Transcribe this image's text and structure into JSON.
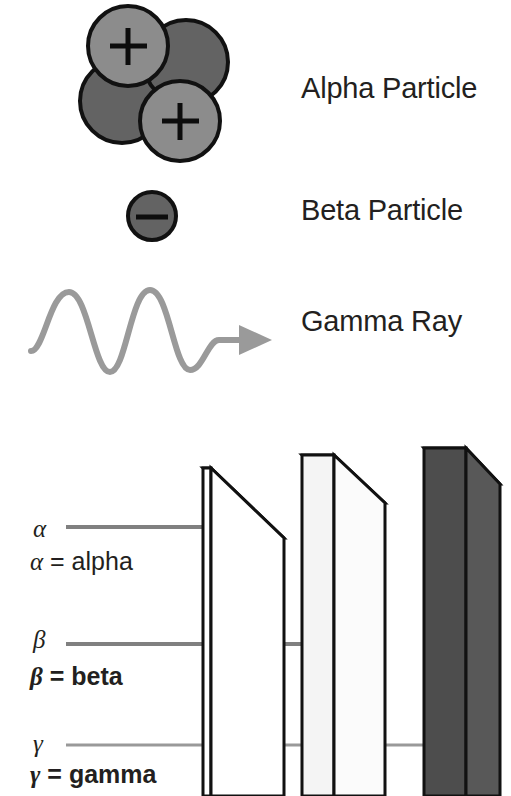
{
  "figure": {
    "background": "#ffffff"
  },
  "legend": {
    "items": [
      {
        "id": "alpha",
        "label": "Alpha Particle",
        "icon": "alpha-particle-icon",
        "charges": [
          "+",
          "+"
        ],
        "nucleon_count": 4
      },
      {
        "id": "beta",
        "label": "Beta Particle",
        "icon": "beta-particle-icon",
        "charges": [
          "–"
        ],
        "nucleon_count": 1
      },
      {
        "id": "gamma",
        "label": "Gamma Ray",
        "icon": "gamma-ray-wave-icon",
        "charges": [],
        "nucleon_count": 0
      }
    ]
  },
  "penetration": {
    "rays": [
      {
        "id": "alpha",
        "symbol": "α",
        "legend_text": "= alpha",
        "legend_full": "α = alpha",
        "bold": false,
        "stops_at_barrier": 1,
        "line_color": "#808080"
      },
      {
        "id": "beta",
        "symbol": "β",
        "legend_text": "= beta",
        "legend_full": "β = beta",
        "bold": true,
        "stops_at_barrier": 2,
        "line_color": "#808080"
      },
      {
        "id": "gamma",
        "symbol": "γ",
        "legend_text": "= gamma",
        "legend_full": "γ = gamma",
        "bold": true,
        "stops_at_barrier": 3,
        "line_color": "#999999"
      }
    ],
    "barriers": [
      {
        "id": "barrier-1",
        "fill": "#ffffff",
        "side_fill": "#ffffff"
      },
      {
        "id": "barrier-2",
        "fill": "#f2f2f2",
        "side_fill": "#fafafa"
      },
      {
        "id": "barrier-3",
        "fill": "#4d4d4d",
        "side_fill": "#595959"
      }
    ]
  },
  "colors": {
    "ink": "#231f20",
    "outline": "#111111",
    "nucleon_light": "#8c8c8c",
    "nucleon_dark": "#636363",
    "wave": "#9a9a9a",
    "rule": "#808080",
    "slab_dark": "#4d4d4d",
    "slab_light": "#f2f2f2"
  }
}
